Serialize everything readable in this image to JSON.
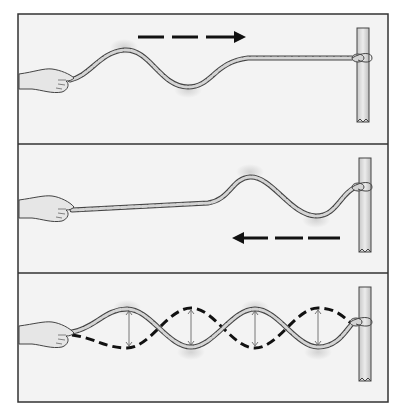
{
  "figure": {
    "colors": {
      "background": "#ffffff",
      "panel_fill": "#f3f3f3",
      "frame": "#333333",
      "rope_fill": "#cfcfcf",
      "rope_outline": "#444444",
      "post_fill": "#dcdcdc",
      "hand_fill": "#e6e6e6",
      "arrow": "#111111",
      "highlight": "#d8d8d8"
    },
    "panels": [
      {
        "id": "incident-wave",
        "caption": "",
        "direction_arrow": "right",
        "wave": "single pulse traveling toward post"
      },
      {
        "id": "reflected-wave",
        "caption": "",
        "direction_arrow": "left",
        "wave": "single pulse reflected from post"
      },
      {
        "id": "standing-wave",
        "caption": "",
        "direction_arrow": "none",
        "wave": "standing wave with two states (solid and dashed) and amplitude arrows at antinodes",
        "antinode_count": 4
      }
    ]
  }
}
